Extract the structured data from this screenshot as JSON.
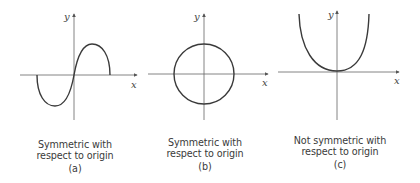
{
  "figures": [
    {
      "id": "a",
      "caption_line1": "Symmetric with",
      "caption_line2": "respect to origin",
      "tag": "(a)",
      "x_label": "x",
      "y_label": "y",
      "curve": "odd cubic-like (sine-shaped) through origin"
    },
    {
      "id": "b",
      "caption_line1": "Symmetric with",
      "caption_line2": "respect to origin",
      "tag": "(b)",
      "x_label": "x",
      "y_label": "y",
      "curve": "circle centered at origin"
    },
    {
      "id": "c",
      "caption_line1": "Not symmetric with",
      "caption_line2": "respect to origin",
      "tag": "(c)",
      "x_label": "x",
      "y_label": "y",
      "curve": "even quartic-like (U-shaped) touching origin"
    }
  ],
  "colors": {
    "stroke": "#3a3a3a",
    "axis": "#555555",
    "background": "#ffffff"
  }
}
